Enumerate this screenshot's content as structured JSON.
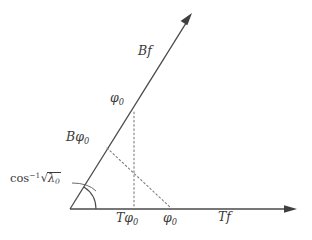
{
  "figure": {
    "type": "geometric-diagram",
    "background_color": "#ffffff",
    "line_color": "#4a4a4a",
    "dotted_color": "#8a8a8a",
    "text_color": "#3a3a3a"
  },
  "axes": {
    "horizontal": {
      "label": "Tf",
      "label_calligraphic_prefix": "T",
      "label_italic_suffix": "f",
      "origin": {
        "x": 70,
        "y": 209
      },
      "tip": {
        "x": 297,
        "y": 209
      },
      "arrowhead": "right"
    },
    "slanted": {
      "label": "Bf",
      "label_calligraphic_prefix": "B",
      "label_italic_suffix": "f",
      "origin": {
        "x": 70,
        "y": 209
      },
      "tip": {
        "x": 192,
        "y": 13
      },
      "arrowhead": "up-right",
      "angle_degrees": 58
    }
  },
  "angle": {
    "label_operator": "cos",
    "label_exponent": "-1",
    "label_radicand_symbol": "λ",
    "label_radicand_subscript": "0",
    "arc_radius": 26,
    "leader_from": {
      "x": 72,
      "y": 183
    },
    "leader_to": {
      "x": 96,
      "y": 190
    }
  },
  "points": [
    {
      "id": "phi0-on-ray",
      "label_symbol": "φ",
      "label_subscript": "0",
      "x": 134,
      "y": 112,
      "on": "slanted-ray"
    },
    {
      "id": "bphi0-on-ray",
      "label_prefix": "B",
      "label_symbol": "φ",
      "label_subscript": "0",
      "x": 107,
      "y": 148,
      "on": "slanted-ray"
    },
    {
      "id": "tphi0-on-axis",
      "label_prefix": "T",
      "label_symbol": "φ",
      "label_subscript": "0",
      "x": 134,
      "y": 209,
      "on": "horizontal-axis"
    },
    {
      "id": "phi0-on-axis",
      "label_symbol": "φ",
      "label_subscript": "0",
      "x": 171,
      "y": 209,
      "on": "horizontal-axis"
    }
  ],
  "dotted_lines": [
    {
      "id": "vertical-projection",
      "from": {
        "x": 134,
        "y": 112
      },
      "to": {
        "x": 134,
        "y": 209
      },
      "style": "dotted"
    },
    {
      "id": "oblique-projection",
      "from": {
        "x": 107,
        "y": 148
      },
      "to": {
        "x": 171,
        "y": 209
      },
      "style": "dotted"
    }
  ],
  "labels": {
    "bf": {
      "prefix": "B",
      "suffix": "f"
    },
    "phi0_ray": {
      "symbol": "φ",
      "subscript": "0"
    },
    "bphi0": {
      "prefix": "B",
      "symbol": "φ",
      "subscript": "0"
    },
    "cos_inverse": {
      "op": "cos",
      "exponent": "−1",
      "lambda": "λ",
      "lambda_subscript": "0"
    },
    "tphi0": {
      "prefix": "T",
      "symbol": "φ",
      "subscript": "0"
    },
    "phi0_axis": {
      "symbol": "φ",
      "subscript": "0"
    },
    "tf": {
      "prefix": "T",
      "suffix": "f"
    }
  }
}
